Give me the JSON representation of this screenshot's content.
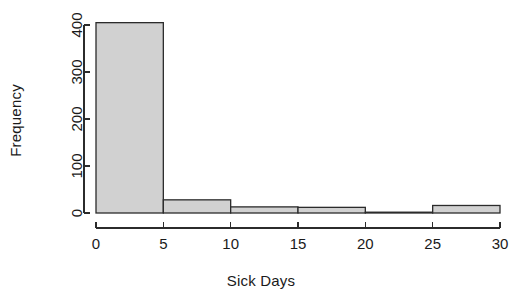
{
  "chart_data": {
    "type": "bar",
    "title": "",
    "subtitle": "",
    "xlabel": "Sick Days",
    "ylabel": "Frequency",
    "histogram": true,
    "bin_width": 5,
    "bin_edges": [
      0,
      5,
      10,
      15,
      20,
      25,
      30
    ],
    "categories": [
      "0-5",
      "5-10",
      "10-15",
      "15-20",
      "20-25",
      "25-30"
    ],
    "values": [
      405,
      28,
      13,
      12,
      1,
      16
    ],
    "x_ticks": [
      0,
      5,
      10,
      15,
      20,
      25,
      30
    ],
    "x_tick_labels": [
      "0",
      "5",
      "10",
      "15",
      "20",
      "25",
      "30"
    ],
    "y_ticks": [
      0,
      100,
      200,
      300,
      400
    ],
    "y_tick_labels": [
      "0",
      "100",
      "200",
      "300",
      "400"
    ],
    "xlim": [
      0,
      30
    ],
    "ylim": [
      0,
      430
    ],
    "grid": false,
    "legend": false,
    "bar_fill_color": "#d1d1d1",
    "bar_border_color": "#2b2b2b",
    "axis_color": "#2b2b2b",
    "background_color": "#ffffff",
    "text_color": "#1a1a1a"
  }
}
